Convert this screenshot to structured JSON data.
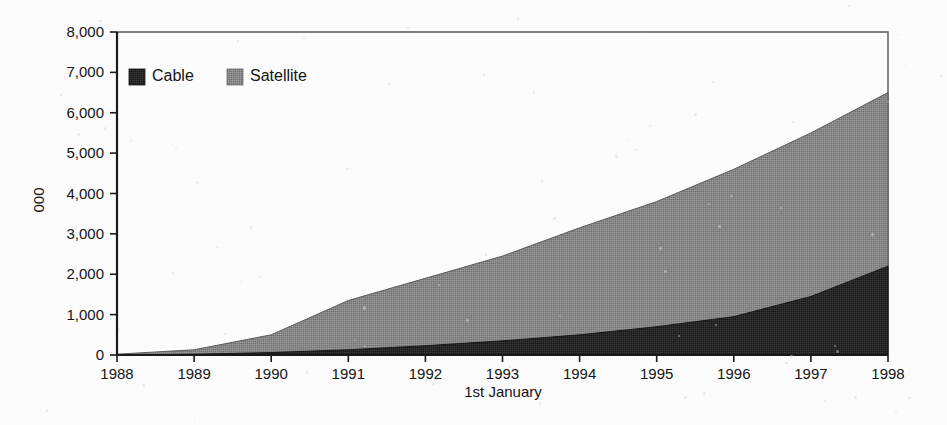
{
  "chart_data": {
    "type": "area",
    "stacked": true,
    "title": "",
    "subtitle": "",
    "xlabel": "1st January",
    "ylabel": "000",
    "x": [
      1988,
      1989,
      1990,
      1991,
      1992,
      1993,
      1994,
      1995,
      1996,
      1997,
      1998
    ],
    "xtick_labels": [
      "1988",
      "1989",
      "1990",
      "1991",
      "1992",
      "1993",
      "1994",
      "1995",
      "1996",
      "1997",
      "1998"
    ],
    "ytick_labels": [
      "0",
      "1,000",
      "2,000",
      "3,000",
      "4,000",
      "5,000",
      "6,000",
      "7,000",
      "8,000"
    ],
    "ytick_values": [
      0,
      1000,
      2000,
      3000,
      4000,
      5000,
      6000,
      7000,
      8000
    ],
    "xlim": [
      1988,
      1998
    ],
    "ylim": [
      0,
      8000
    ],
    "grid": false,
    "legend_position": "top-left-inside",
    "series": [
      {
        "name": "Cable",
        "color": "#262626",
        "values": [
          0,
          20,
          60,
          130,
          230,
          350,
          500,
          700,
          950,
          1450,
          2200
        ]
      },
      {
        "name": "Satellite",
        "color": "#808080",
        "values": [
          20,
          110,
          440,
          1220,
          1670,
          2100,
          2650,
          3100,
          3650,
          4050,
          4300
        ]
      }
    ],
    "cumulative_totals": [
      20,
      130,
      500,
      1350,
      1900,
      2450,
      3150,
      3800,
      4600,
      5500,
      6500
    ],
    "annotations": []
  },
  "legend": {
    "items": [
      {
        "label": "Cable",
        "color": "#262626"
      },
      {
        "label": "Satellite",
        "color": "#808080"
      }
    ]
  },
  "axes": {
    "y_title": "000",
    "x_title": "1st January"
  }
}
